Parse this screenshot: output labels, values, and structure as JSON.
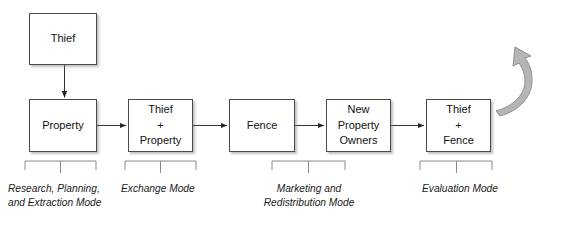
{
  "diagram": {
    "canvas": {
      "width": 566,
      "height": 229
    },
    "colors": {
      "box_border": "#4a4a4a",
      "box_fill": "#ffffff",
      "line": "#333333",
      "curve_fill": "#b0b0b0",
      "curve_stroke": "#8c8c8c",
      "text": "#101010",
      "background": "#ffffff"
    },
    "nodes": [
      {
        "id": "thief",
        "label": "Thief",
        "x": 29,
        "y": 13,
        "w": 68,
        "h": 52
      },
      {
        "id": "property",
        "label": "Property",
        "x": 29,
        "y": 99,
        "w": 68,
        "h": 53
      },
      {
        "id": "thief-property",
        "label": "Thief\n+\nProperty",
        "x": 128,
        "y": 99,
        "w": 65,
        "h": 53
      },
      {
        "id": "fence",
        "label": "Fence",
        "x": 229,
        "y": 99,
        "w": 66,
        "h": 53
      },
      {
        "id": "new-property-owners",
        "label": "New Property\nOwners",
        "x": 326,
        "y": 99,
        "w": 65,
        "h": 53
      },
      {
        "id": "thief-fence",
        "label": "Thief\n+\nFence",
        "x": 426,
        "y": 99,
        "w": 65,
        "h": 53
      }
    ],
    "phases": [
      {
        "id": "research-planning-extraction",
        "label": "Research, Planning,\nand Extraction Mode",
        "bracket_x1": 25,
        "bracket_x2": 96,
        "label_x": 8,
        "label_y": 182,
        "align": "left"
      },
      {
        "id": "exchange",
        "label": "Exchange Mode",
        "bracket_x1": 125,
        "bracket_x2": 196,
        "label_x": 121,
        "label_y": 182,
        "align": "left"
      },
      {
        "id": "marketing-redistribution",
        "label": "Marketing and\nRedistribution Mode",
        "bracket_x1": 272,
        "bracket_x2": 345,
        "label_x": 309,
        "label_y": 182,
        "align": "center"
      },
      {
        "id": "evaluation",
        "label": "Evaluation Mode",
        "bracket_x1": 420,
        "bracket_x2": 492,
        "label_x": 422,
        "label_y": 182,
        "align": "left"
      }
    ],
    "flow_arrows": [
      {
        "id": "thief-to-property",
        "from": "thief",
        "to": "property",
        "direction": "down"
      },
      {
        "id": "property-to-thief-property",
        "from": "property",
        "to": "thief-property",
        "direction": "right"
      },
      {
        "id": "thief-property-to-fence",
        "from": "thief-property",
        "to": "fence",
        "direction": "right"
      },
      {
        "id": "fence-to-new-property-owners",
        "from": "fence",
        "to": "new-property-owners",
        "direction": "right"
      },
      {
        "id": "new-property-owners-to-thief-fence",
        "from": "new-property-owners",
        "to": "thief-fence",
        "direction": "right"
      },
      {
        "id": "thief-fence-recycle",
        "from": "thief-fence",
        "to": "thief",
        "direction": "curve-up-left"
      }
    ]
  }
}
